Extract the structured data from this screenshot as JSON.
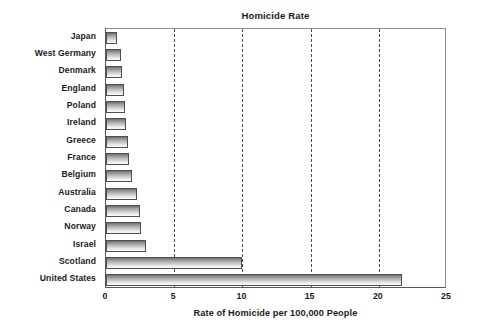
{
  "chart_data": {
    "type": "bar",
    "orientation": "horizontal",
    "title": "Homicide Rate",
    "xlabel": "Rate of Homicide per 100,000 People",
    "ylabel": "",
    "xlim": [
      0,
      25
    ],
    "xticks": [
      "0",
      "5",
      "10",
      "15",
      "20",
      "25"
    ],
    "xtick_values": [
      0,
      5,
      10,
      15,
      20,
      25
    ],
    "grid": "vertical-dashed",
    "legend": "none",
    "categories": [
      "Japan",
      "West Germany",
      "Denmark",
      "England",
      "Poland",
      "Ireland",
      "Greece",
      "France",
      "Belgium",
      "Australia",
      "Canada",
      "Norway",
      "Israel",
      "Scotland",
      "United States"
    ],
    "values": [
      0.8,
      1.1,
      1.2,
      1.3,
      1.4,
      1.5,
      1.6,
      1.7,
      1.9,
      2.3,
      2.5,
      2.6,
      2.9,
      10.0,
      21.7
    ],
    "colors": {
      "bar_gradient_top": "#6e6e6e",
      "bar_gradient_bottom": "#fbfbfb",
      "bar_border": "#4f4f4f",
      "gridline": "#4a4a4a",
      "axis": "#585858",
      "text": "#1b1b1b",
      "background": "#ffffff"
    }
  }
}
